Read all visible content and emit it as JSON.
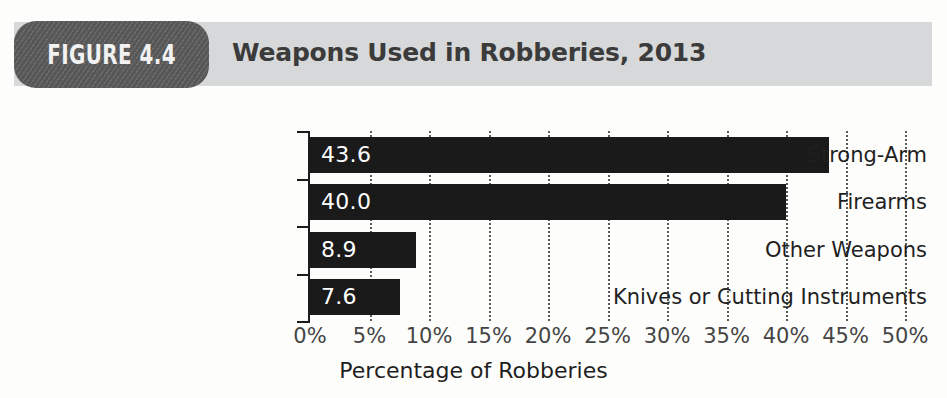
{
  "figure": {
    "badge_label": "FIGURE 4.4",
    "title": "Weapons Used in Robberies, 2013",
    "badge_color": "#5c5c5c",
    "header_bar_color": "#d7d8d9",
    "title_color": "#3b3b3b"
  },
  "chart_data": {
    "type": "bar",
    "orientation": "horizontal",
    "title": "Weapons Used in Robberies, 2013",
    "subtitle": "",
    "categories": [
      "Strong-Arm",
      "Firearms",
      "Other Weapons",
      "Knives or Cutting Instruments"
    ],
    "values": [
      43.6,
      40.0,
      8.9,
      7.6
    ],
    "value_labels": [
      "43.6",
      "40.0",
      "8.9",
      "7.6"
    ],
    "xlabel": "Percentage of Robberies",
    "ylabel": "",
    "xlim": [
      0,
      50
    ],
    "xtick_values": [
      0,
      5,
      10,
      15,
      20,
      25,
      30,
      35,
      40,
      45,
      50
    ],
    "xtick_labels": [
      "0%",
      "5%",
      "10%",
      "15%",
      "20%",
      "25%",
      "30%",
      "35%",
      "40%",
      "45%",
      "50%"
    ],
    "grid": "vertical-dotted",
    "legend": "none",
    "bar_color": "#1a1a1a",
    "value_label_color": "#ffffff"
  }
}
